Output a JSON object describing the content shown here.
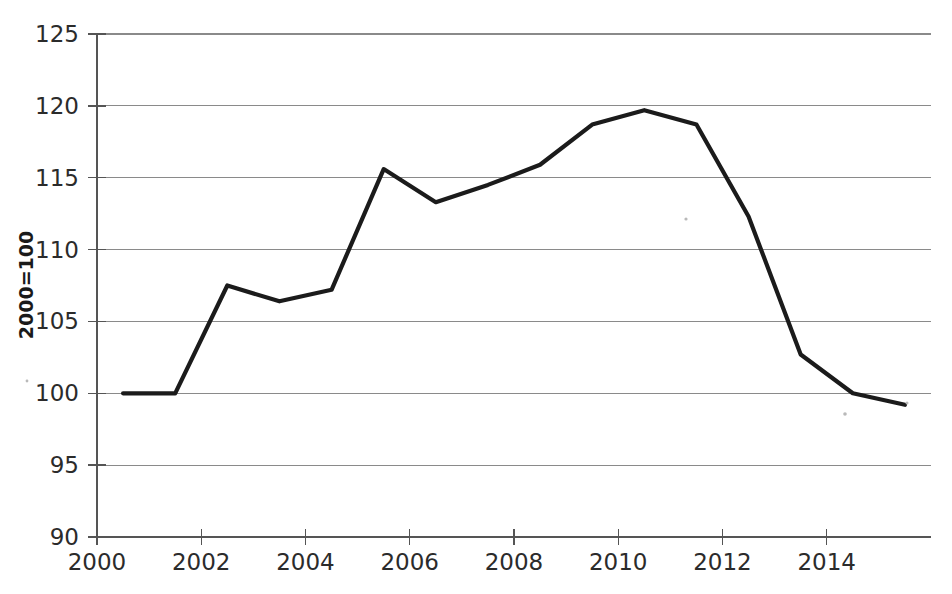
{
  "chart_data": {
    "type": "line",
    "title": "",
    "subtitle": "",
    "xlabel": "",
    "ylabel": "2000=100",
    "xlim": [
      2000,
      2016
    ],
    "ylim": [
      90,
      125
    ],
    "grid": true,
    "legend": "none",
    "x_tick_labels": [
      "2000",
      "2002",
      "2004",
      "2006",
      "2008",
      "2010",
      "2012",
      "2014"
    ],
    "x_ticks": [
      2000,
      2002,
      2004,
      2006,
      2008,
      2010,
      2012,
      2014
    ],
    "y_tick_labels": [
      "90",
      "95",
      "100",
      "105",
      "110",
      "115",
      "120",
      "125"
    ],
    "y_ticks": [
      90,
      95,
      100,
      105,
      110,
      115,
      120,
      125
    ],
    "series": [
      {
        "name": "index",
        "color": "#1b1b1b",
        "x": [
          2000.5,
          2001.5,
          2002.5,
          2003.5,
          2004.5,
          2005.5,
          2006.5,
          2007.5,
          2008.5,
          2009.5,
          2010.5,
          2011.5,
          2012.5,
          2013.5,
          2014.5,
          2015.5
        ],
        "values": [
          100.0,
          100.0,
          107.5,
          106.4,
          107.2,
          115.6,
          113.3,
          114.5,
          115.9,
          118.7,
          119.7,
          118.7,
          112.3,
          102.7,
          100.0,
          99.2
        ]
      }
    ]
  },
  "axis": {
    "y_label_text": "2000=100"
  }
}
